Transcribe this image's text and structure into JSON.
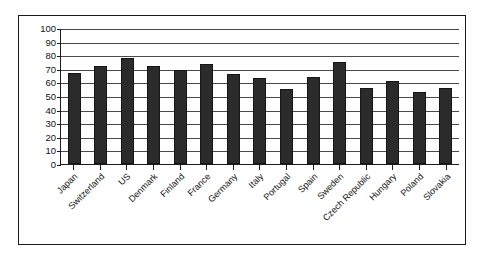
{
  "chart_data": {
    "type": "bar",
    "title": "",
    "subtitle": "",
    "xlabel": "",
    "ylabel": "",
    "ylim": [
      0,
      100
    ],
    "ytick_step": 10,
    "yticks": [
      100,
      90,
      80,
      70,
      60,
      50,
      40,
      30,
      20,
      10,
      0
    ],
    "grid": true,
    "legend": null,
    "legend_position": "none",
    "bar_color": "#2b2b2b",
    "plot_background": "#fefefe",
    "frame_color": "#1b1b1b",
    "categories": [
      "Japan",
      "Switzerland",
      "US",
      "Denmark",
      "Finland",
      "France",
      "Germany",
      "Italy",
      "Portugal",
      "Spain",
      "Sweden",
      "Czech Republic",
      "Hungary",
      "Poland",
      "Slovakia"
    ],
    "values": [
      67,
      72,
      78,
      72,
      69,
      73.5,
      66,
      63,
      55,
      64,
      75,
      56,
      61,
      53,
      56
    ],
    "series": [
      {
        "name": "",
        "values": [
          67,
          72,
          78,
          72,
          69,
          73.5,
          66,
          63,
          55,
          64,
          75,
          56,
          61,
          53,
          56
        ]
      }
    ]
  }
}
